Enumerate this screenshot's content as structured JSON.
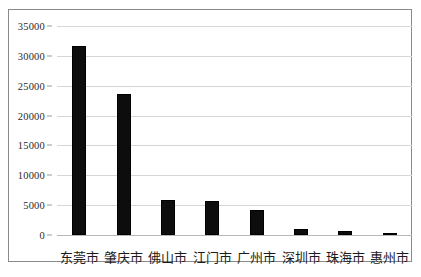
{
  "chart_data": {
    "type": "bar",
    "title": "",
    "xlabel": "",
    "ylabel": "",
    "categories": [
      "东莞市",
      "肇庆市",
      "佛山市",
      "江门市",
      "广州市",
      "深圳市",
      "珠海市",
      "惠州市"
    ],
    "values": [
      31700,
      23600,
      5800,
      5650,
      4200,
      950,
      700,
      200
    ],
    "yticks": [
      "0",
      "5000",
      "10000",
      "15000",
      "20000",
      "25000",
      "30000",
      "35000"
    ],
    "ytick_values": [
      0,
      5000,
      10000,
      15000,
      20000,
      25000,
      30000,
      35000
    ],
    "ylim": [
      0,
      35000
    ],
    "grid": true,
    "legend": null,
    "legend_position": "none",
    "bar_color": "#0d0d0d",
    "gridline_color": "#d6d6d6",
    "axis_color": "#8a8a8a",
    "series": [
      {
        "name": "",
        "values": [
          31700,
          23600,
          5800,
          5650,
          4200,
          950,
          700,
          200
        ]
      }
    ]
  }
}
